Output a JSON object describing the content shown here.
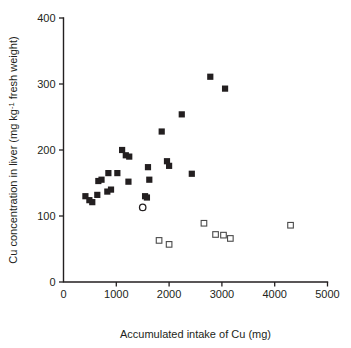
{
  "chart_data": {
    "type": "scatter",
    "title": "",
    "xlabel": "Accumulated intake of Cu (mg)",
    "ylabel": "Cu concentration in liver (mg kg-1 fresh weight)",
    "ylabel_parts": {
      "lead": "Cu concentration in liver (mg kg",
      "exponent": "-1",
      "tail": " fresh weight)"
    },
    "xlim": [
      0,
      5000
    ],
    "ylim": [
      0,
      400
    ],
    "xticks": [
      0,
      1000,
      2000,
      3000,
      4000,
      5000
    ],
    "yticks": [
      0,
      100,
      200,
      300,
      400
    ],
    "xtick_labels": [
      "0",
      "1000",
      "2000",
      "3000",
      "4000",
      "5000"
    ],
    "ytick_labels": [
      "0",
      "100",
      "200",
      "300",
      "400"
    ],
    "grid": false,
    "legend": "none",
    "series": [
      {
        "name": "filled-square",
        "marker": "filled square",
        "color": "#231f20",
        "points": [
          [
            415,
            130
          ],
          [
            490,
            124
          ],
          [
            545,
            121
          ],
          [
            640,
            132
          ],
          [
            660,
            153
          ],
          [
            720,
            155
          ],
          [
            830,
            137
          ],
          [
            850,
            165
          ],
          [
            900,
            140
          ],
          [
            1020,
            165
          ],
          [
            1110,
            200
          ],
          [
            1180,
            192
          ],
          [
            1230,
            152
          ],
          [
            1245,
            190
          ],
          [
            1545,
            130
          ],
          [
            1580,
            128
          ],
          [
            1600,
            174
          ],
          [
            1625,
            155
          ],
          [
            1960,
            183
          ],
          [
            2000,
            176
          ],
          [
            1860,
            228
          ],
          [
            2240,
            254
          ],
          [
            2430,
            164
          ],
          [
            2780,
            311
          ],
          [
            3060,
            293
          ]
        ]
      },
      {
        "name": "open-square",
        "marker": "open square",
        "color": "#4a4a4a",
        "points": [
          [
            1810,
            63
          ],
          [
            2000,
            57
          ],
          [
            2660,
            89
          ],
          [
            2880,
            72
          ],
          [
            3030,
            71
          ],
          [
            3160,
            66
          ],
          [
            4300,
            86
          ]
        ]
      },
      {
        "name": "open-circle",
        "marker": "open circle",
        "color": "#231f20",
        "points": [
          [
            1500,
            113
          ]
        ]
      }
    ]
  },
  "figure": {
    "background_color": "#ffffff",
    "axis_color": "#231f20"
  }
}
